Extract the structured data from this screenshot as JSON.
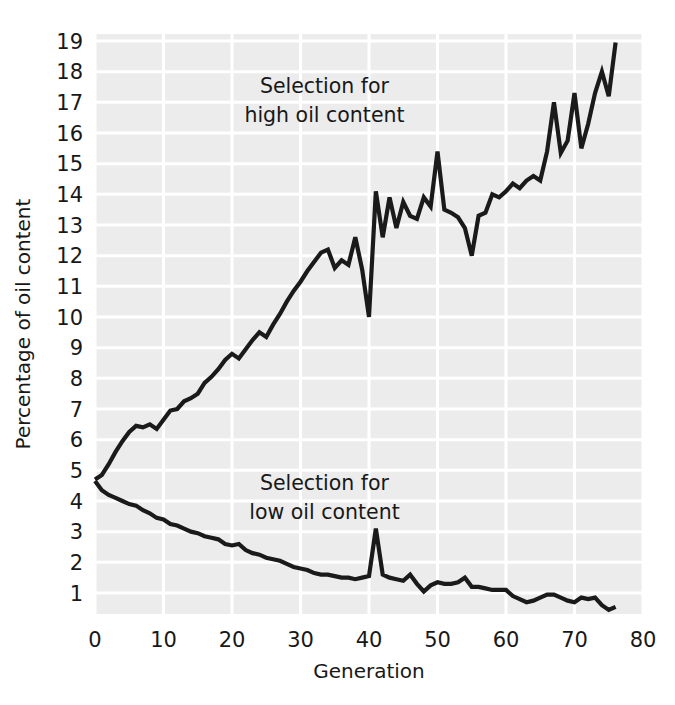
{
  "chart_data": {
    "type": "line",
    "title": "",
    "xlabel": "Generation",
    "ylabel": "Percentage of oil content",
    "xlim": [
      0,
      80
    ],
    "ylim": [
      0,
      19.6
    ],
    "xticks": [
      0,
      10,
      20,
      30,
      40,
      50,
      60,
      70,
      80
    ],
    "xtick_labels": [
      "0",
      "10",
      "20",
      "30",
      "40",
      "50",
      "60",
      "70",
      "80"
    ],
    "yticks": [
      1,
      2,
      3,
      4,
      5,
      6,
      7,
      8,
      9,
      10,
      11,
      12,
      13,
      14,
      15,
      16,
      17,
      18,
      19
    ],
    "ytick_labels": [
      "1",
      "2",
      "3",
      "4",
      "5",
      "6",
      "7",
      "8",
      "9",
      "10",
      "11",
      "12",
      "13",
      "14",
      "15",
      "16",
      "17",
      "18",
      "19"
    ],
    "grid": true,
    "grid_color": "#ffffff",
    "plot_background": "#ececec",
    "line_color": "#1a1a1a",
    "legend_position": "inline-annotations",
    "annotations": [
      {
        "name": "high-oil-annotation",
        "line1": "Selection for",
        "line2": "high oil content",
        "x": 33.5,
        "y": 17.3
      },
      {
        "name": "low-oil-annotation",
        "line1": "Selection for",
        "line2": "low oil content",
        "x": 33.5,
        "y": 4.35
      }
    ],
    "series": [
      {
        "name": "Selection for high oil content",
        "x": [
          0,
          1,
          2,
          3,
          4,
          5,
          6,
          7,
          8,
          9,
          10,
          11,
          12,
          13,
          14,
          15,
          16,
          17,
          18,
          19,
          20,
          21,
          22,
          23,
          24,
          25,
          26,
          27,
          28,
          29,
          30,
          31,
          32,
          33,
          34,
          35,
          36,
          37,
          38,
          39,
          40,
          41,
          42,
          43,
          44,
          45,
          46,
          47,
          48,
          49,
          50,
          51,
          52,
          53,
          54,
          55,
          56,
          57,
          58,
          59,
          60,
          61,
          62,
          63,
          64,
          65,
          66,
          67,
          68,
          69,
          70,
          71,
          72,
          73,
          74,
          75,
          76
        ],
        "values": [
          4.7,
          4.85,
          5.2,
          5.6,
          5.95,
          6.25,
          6.45,
          6.4,
          6.5,
          6.35,
          6.65,
          6.95,
          7.0,
          7.25,
          7.35,
          7.5,
          7.85,
          8.05,
          8.3,
          8.6,
          8.8,
          8.65,
          8.95,
          9.25,
          9.5,
          9.35,
          9.75,
          10.1,
          10.5,
          10.85,
          11.15,
          11.5,
          11.8,
          12.1,
          12.2,
          11.6,
          11.85,
          11.7,
          12.6,
          11.55,
          10.0,
          14.1,
          12.6,
          13.9,
          12.9,
          13.75,
          13.3,
          13.2,
          13.9,
          13.6,
          15.4,
          13.5,
          13.4,
          13.25,
          12.9,
          12.0,
          13.3,
          13.4,
          14.0,
          13.9,
          14.1,
          14.35,
          14.2,
          14.45,
          14.6,
          14.45,
          15.4,
          17.0,
          15.35,
          15.75,
          17.3,
          15.5,
          16.3,
          17.3,
          18.0,
          17.2,
          18.95
        ]
      },
      {
        "name": "Selection for low oil content",
        "x": [
          0,
          1,
          2,
          3,
          4,
          5,
          6,
          7,
          8,
          9,
          10,
          11,
          12,
          13,
          14,
          15,
          16,
          17,
          18,
          19,
          20,
          21,
          22,
          23,
          24,
          25,
          26,
          27,
          28,
          29,
          30,
          31,
          32,
          33,
          34,
          35,
          36,
          37,
          38,
          39,
          40,
          41,
          42,
          43,
          44,
          45,
          46,
          47,
          48,
          49,
          50,
          51,
          52,
          53,
          54,
          55,
          56,
          57,
          58,
          59,
          60,
          61,
          62,
          63,
          64,
          65,
          66,
          67,
          68,
          69,
          70,
          71,
          72,
          73,
          74,
          75,
          76
        ],
        "values": [
          4.65,
          4.35,
          4.2,
          4.1,
          4.0,
          3.9,
          3.85,
          3.7,
          3.6,
          3.45,
          3.4,
          3.25,
          3.2,
          3.1,
          3.0,
          2.95,
          2.85,
          2.8,
          2.75,
          2.6,
          2.55,
          2.6,
          2.4,
          2.3,
          2.25,
          2.15,
          2.1,
          2.05,
          1.95,
          1.85,
          1.8,
          1.75,
          1.65,
          1.6,
          1.6,
          1.55,
          1.5,
          1.5,
          1.45,
          1.5,
          1.55,
          3.1,
          1.6,
          1.5,
          1.45,
          1.4,
          1.6,
          1.3,
          1.05,
          1.25,
          1.35,
          1.3,
          1.3,
          1.35,
          1.5,
          1.2,
          1.2,
          1.15,
          1.1,
          1.1,
          1.1,
          0.9,
          0.8,
          0.7,
          0.75,
          0.85,
          0.95,
          0.95,
          0.85,
          0.75,
          0.7,
          0.85,
          0.8,
          0.85,
          0.6,
          0.45,
          0.55
        ]
      }
    ]
  }
}
